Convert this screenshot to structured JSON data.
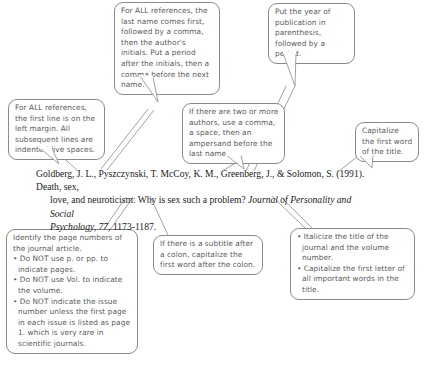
{
  "diagram": {
    "ink_color": "#5b5b5b",
    "line_color": "#8a8a8a",
    "text_color": "#1b1b1b"
  },
  "citation": {
    "line1": "Goldberg, J. L., Pyszczynski, T. McCoy, K. M., Greenberg, J., & Solomon, S. (1991). Death, sex,",
    "line2_plain_a": "love, and neuroticism: Why is sex such a problem? ",
    "line2_italic": "Journal of Personality and Social",
    "line3_italic": "Psychology, 77,",
    "line3_plain": " 1173-1187."
  },
  "callouts": {
    "last_name": {
      "text": "For ALL references, the last name comes first, followed by a comma, then the author's initials. Put a period after the initials, then a comma before the next name."
    },
    "year": {
      "text": "Put the year of publication in parenthesis, followed by a period."
    },
    "first_line": {
      "text": "For ALL references, the first line is on the left margin. All subsequent lines are indented five spaces."
    },
    "authors": {
      "text": "If there are two or more authors, use a comma, a space, then an ampersand before the last name."
    },
    "capitalize_title": {
      "text": "Capitalize the first word of the title."
    },
    "pages": {
      "intro": "Identify the page numbers of the journal article.",
      "bullets": [
        "• Do NOT use p. or pp. to indicate pages.",
        "• Do NOT use Vol. to indicate the volume.",
        "• Do NOT indicate the issue number unless the first page in each issue is listed as page 1. which is very rare in scientific journals."
      ]
    },
    "subtitle": {
      "text": "If there is a subtitle after a colon, capitalize the first word after the colon."
    },
    "italicize": {
      "bullets": [
        "• Italicize the title of the journal and the volume number.",
        "• Capitalize the first letter of all important words in the title."
      ]
    }
  }
}
